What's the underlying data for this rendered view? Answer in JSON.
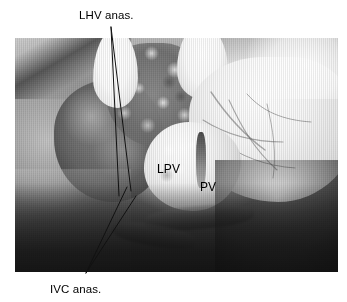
{
  "figure": {
    "type": "intraoperative-photograph",
    "frame": {
      "x": 15,
      "y": 38,
      "width": 323,
      "height": 234,
      "background_color": "#ffffff",
      "photo_tone": "grayscale"
    }
  },
  "annotations": {
    "outside_labels": [
      {
        "id": "lhv",
        "text": "LHV anas.",
        "meaning": "left hepatic vein anastomosis",
        "position": "top-center-left",
        "x": 79,
        "y": 9,
        "leader_lines": 2
      },
      {
        "id": "ivc",
        "text": "IVC anas.",
        "meaning": "inferior vena cava anastomosis",
        "position": "bottom-left",
        "x": 50,
        "y": 283,
        "leader_lines": 2
      }
    ],
    "inside_labels": [
      {
        "id": "lpv",
        "text": "LPV",
        "meaning": "left portal vein",
        "x": 157,
        "y": 162
      },
      {
        "id": "pv",
        "text": "PV",
        "meaning": "portal vein",
        "x": 200,
        "y": 180
      }
    ],
    "leader_color": "#111111",
    "text_color": "#000000"
  },
  "leaders": {
    "lhv": {
      "apex_x": 111,
      "apex_y": 27,
      "target_a_x": 119,
      "target_a_y": 196,
      "target_b_x": 131,
      "target_b_y": 191
    },
    "ivc": {
      "apex_x": 86,
      "apex_y": 273,
      "target_a_x": 127,
      "target_a_y": 187,
      "target_b_x": 136,
      "target_b_y": 196
    }
  },
  "palette": {
    "page_background": "#ffffff",
    "photo_mid": "#8a8a8a",
    "photo_dark": "#1e1e1e",
    "photo_light": "#ffffff",
    "label_text": "#000000",
    "leader_stroke": "#111111"
  }
}
